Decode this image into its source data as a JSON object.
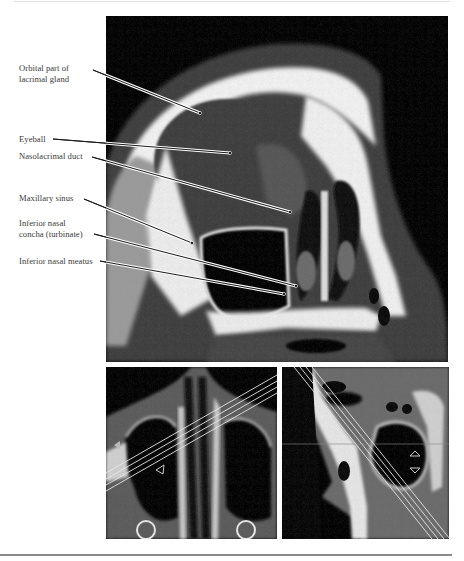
{
  "figure": {
    "labels": [
      {
        "id": "orbital-lacrimal",
        "text": "Orbital part of\nlacrimal gland",
        "top": 63,
        "anchor": [
          93,
          70
        ],
        "target": [
          200,
          113
        ]
      },
      {
        "id": "eyeball",
        "text": "Eyeball",
        "top": 134,
        "anchor": [
          53,
          139
        ],
        "target": [
          230,
          153
        ]
      },
      {
        "id": "nasolacrimal-duct",
        "text": "Nasolacrimal duct",
        "top": 151,
        "anchor": [
          92,
          157
        ],
        "target": [
          290,
          212
        ]
      },
      {
        "id": "maxillary-sinus",
        "text": "Maxillary sinus",
        "top": 193,
        "anchor": [
          84,
          199
        ],
        "target": [
          192,
          243
        ]
      },
      {
        "id": "inferior-nasal-concha",
        "text": "Inferior nasal\nconcha (turbinate)",
        "top": 218,
        "anchor": [
          94,
          234
        ],
        "target": [
          296,
          286
        ]
      },
      {
        "id": "inferior-nasal-meatus",
        "text": "Inferior nasal meatus",
        "top": 256,
        "anchor": [
          100,
          261
        ],
        "target": [
          284,
          294
        ]
      }
    ],
    "panels": {
      "main": {
        "name": "coronal-ct-main",
        "x": 106,
        "y": 16,
        "w": 342,
        "h": 346
      },
      "bottom_left": {
        "name": "axial-ct-nasal",
        "x": 106,
        "y": 367,
        "w": 171,
        "h": 172
      },
      "bottom_right": {
        "name": "sagittal-ct-sinus",
        "x": 282,
        "y": 367,
        "w": 167,
        "h": 172
      }
    },
    "colors": {
      "label_text": "#3a3a3a",
      "leader_line": "#1a1a1a",
      "bone": "#f4f4f4",
      "soft_tissue": "#4a4a4a",
      "air": "#050505"
    }
  }
}
